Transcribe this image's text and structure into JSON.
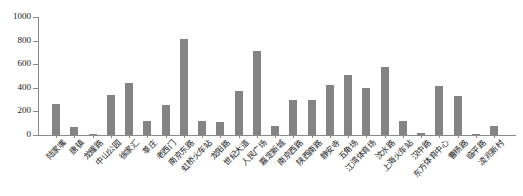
{
  "chart_data": {
    "type": "bar",
    "title": "",
    "subtitle": "",
    "xlabel": "",
    "ylabel": "",
    "ylim": [
      0,
      1000
    ],
    "yticks": [
      0,
      200,
      400,
      600,
      800,
      1000
    ],
    "ytick_labels": [
      "0",
      "200",
      "400",
      "600",
      "800",
      "1000"
    ],
    "grid": false,
    "legend": null,
    "bar_color": "#848484",
    "axis_color": "#8a8a8a",
    "categories": [
      "陆家嘴",
      "唐镇",
      "龙耀路",
      "中山公园",
      "徐家汇",
      "莘庄",
      "老西门",
      "南京东路",
      "虹桥火车站",
      "龙阳路",
      "世纪大道",
      "人民广场",
      "嘉定新城",
      "南京西路",
      "陕西南路",
      "静安寺",
      "五角场",
      "江湾体育场",
      "汶水路",
      "上海火车站",
      "汉中路",
      "东方体育中心",
      "曹杨路",
      "临平路",
      "凌兆新村"
    ],
    "values": [
      265,
      65,
      8,
      340,
      445,
      120,
      255,
      810,
      115,
      110,
      375,
      710,
      80,
      300,
      295,
      420,
      505,
      400,
      580,
      115,
      20,
      415,
      330,
      10,
      75
    ]
  }
}
